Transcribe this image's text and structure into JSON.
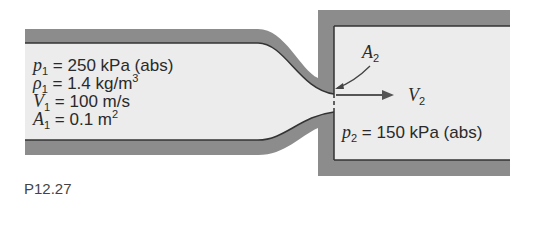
{
  "figure": {
    "caption": "P12.27",
    "inlet": {
      "p1": {
        "symbol": "p",
        "sub": "1",
        "eq": " = 250 kPa (abs)"
      },
      "rho1": {
        "symbol": "ρ",
        "sub": "1",
        "eq": " = 1.4 kg/m",
        "sup": "3"
      },
      "V1": {
        "symbol": "V",
        "sub": "1",
        "eq": " = 100 m/s"
      },
      "A1": {
        "symbol": "A",
        "sub": "1",
        "eq": " = 0.1 m",
        "sup": "2"
      }
    },
    "throat": {
      "symbol": "A",
      "sub": "2"
    },
    "exit_velocity": {
      "symbol": "V",
      "sub": "2"
    },
    "tank": {
      "p2": {
        "symbol": "p",
        "sub": "2",
        "eq": " = 150 kPa (abs)"
      }
    },
    "colors": {
      "wall": "#8c8c8c",
      "fluid": "#ececec",
      "line": "#333333",
      "arrow": "#555555"
    }
  }
}
